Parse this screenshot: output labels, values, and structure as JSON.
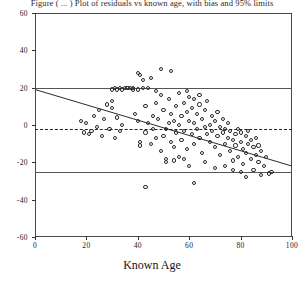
{
  "chart_data": {
    "type": "scatter",
    "title": "Figure ( ... ) Plot of residuals vs known age, with bias and 95% limits",
    "xlabel": "Known Age",
    "ylabel": "",
    "xlim": [
      0,
      100
    ],
    "ylim": [
      -60,
      60
    ],
    "xticks": [
      0,
      20,
      40,
      60,
      80,
      100
    ],
    "yticks": [
      60,
      40,
      20,
      0,
      -20,
      -40,
      -60
    ],
    "grid": false,
    "legend": "none",
    "annotations": {
      "upper_limit_label": "+20",
      "mean_bias_label": "-2",
      "lower_limit_label": "-25"
    },
    "reference_lines": [
      {
        "name": "upper-agreement-limit",
        "y": 20,
        "style": "solid"
      },
      {
        "name": "mean-bias-line",
        "y": -2,
        "style": "dashed"
      },
      {
        "name": "lower-agreement-limit",
        "y": -25,
        "style": "solid"
      }
    ],
    "regression_line": {
      "name": "regression-line",
      "x_start": 0,
      "y_start": 19,
      "x_end": 100,
      "y_end": -22,
      "slope": -0.41,
      "intercept": 19
    },
    "points": [
      [
        18,
        2
      ],
      [
        19,
        -4
      ],
      [
        20,
        1
      ],
      [
        21,
        -5
      ],
      [
        22,
        -3
      ],
      [
        23,
        5
      ],
      [
        24,
        -1
      ],
      [
        25,
        8
      ],
      [
        26,
        -6
      ],
      [
        27,
        3
      ],
      [
        28,
        11
      ],
      [
        29,
        -2
      ],
      [
        30,
        9
      ],
      [
        30,
        13
      ],
      [
        31,
        -7
      ],
      [
        32,
        4
      ],
      [
        33,
        -3
      ],
      [
        34,
        0
      ],
      [
        35,
        20
      ],
      [
        36,
        20
      ],
      [
        37,
        20
      ],
      [
        38,
        20
      ],
      [
        38,
        19
      ],
      [
        39,
        6
      ],
      [
        40,
        19
      ],
      [
        40,
        2
      ],
      [
        40,
        28
      ],
      [
        41,
        -9
      ],
      [
        41,
        -11
      ],
      [
        42,
        24
      ],
      [
        42,
        20
      ],
      [
        43,
        10
      ],
      [
        43,
        -4
      ],
      [
        44,
        20
      ],
      [
        44,
        1
      ],
      [
        45,
        -10
      ],
      [
        46,
        5
      ],
      [
        46,
        -2
      ],
      [
        47,
        12
      ],
      [
        47,
        -7
      ],
      [
        48,
        3
      ],
      [
        49,
        -14
      ],
      [
        49,
        30
      ],
      [
        50,
        8
      ],
      [
        50,
        -6
      ],
      [
        51,
        -2
      ],
      [
        51,
        -18
      ],
      [
        52,
        14
      ],
      [
        52,
        1
      ],
      [
        53,
        -9
      ],
      [
        53,
        6
      ],
      [
        54,
        2
      ],
      [
        54,
        -12
      ],
      [
        55,
        10
      ],
      [
        55,
        -4
      ],
      [
        56,
        17
      ],
      [
        56,
        0
      ],
      [
        57,
        -8
      ],
      [
        57,
        5
      ],
      [
        58,
        12
      ],
      [
        58,
        -3
      ],
      [
        59,
        7
      ],
      [
        59,
        -13
      ],
      [
        60,
        2
      ],
      [
        60,
        15
      ],
      [
        61,
        -5
      ],
      [
        61,
        9
      ],
      [
        62,
        1
      ],
      [
        62,
        -10
      ],
      [
        63,
        6
      ],
      [
        63,
        -2
      ],
      [
        64,
        11
      ],
      [
        64,
        -7
      ],
      [
        65,
        3
      ],
      [
        65,
        -15
      ],
      [
        66,
        8
      ],
      [
        66,
        -1
      ],
      [
        67,
        -5
      ],
      [
        67,
        13
      ],
      [
        68,
        0
      ],
      [
        68,
        -9
      ],
      [
        69,
        5
      ],
      [
        69,
        -3
      ],
      [
        70,
        -12
      ],
      [
        70,
        2
      ],
      [
        71,
        -6
      ],
      [
        71,
        7
      ],
      [
        72,
        -1
      ],
      [
        72,
        -16
      ],
      [
        73,
        -4
      ],
      [
        73,
        3
      ],
      [
        74,
        -10
      ],
      [
        74,
        -2
      ],
      [
        75,
        -7
      ],
      [
        75,
        1
      ],
      [
        76,
        -14
      ],
      [
        76,
        -3
      ],
      [
        77,
        -8
      ],
      [
        77,
        -19
      ],
      [
        78,
        -5
      ],
      [
        78,
        -11
      ],
      [
        79,
        -2
      ],
      [
        79,
        -17
      ],
      [
        80,
        -9
      ],
      [
        80,
        -4
      ],
      [
        81,
        -13
      ],
      [
        81,
        -21
      ],
      [
        82,
        -6
      ],
      [
        82,
        -15
      ],
      [
        83,
        -10
      ],
      [
        83,
        -3
      ],
      [
        84,
        -18
      ],
      [
        84,
        -8
      ],
      [
        85,
        -12
      ],
      [
        85,
        -24
      ],
      [
        86,
        -7
      ],
      [
        86,
        -16
      ],
      [
        87,
        -20
      ],
      [
        87,
        -11
      ],
      [
        88,
        -14
      ],
      [
        89,
        -22
      ],
      [
        90,
        -17
      ],
      [
        91,
        -26
      ],
      [
        92,
        -25
      ],
      [
        43,
        -33
      ],
      [
        62,
        -31
      ],
      [
        82,
        -28
      ],
      [
        88,
        -27
      ],
      [
        30,
        19
      ],
      [
        31,
        20
      ],
      [
        32,
        19
      ],
      [
        33,
        20
      ],
      [
        34,
        19
      ],
      [
        53,
        29
      ],
      [
        41,
        27
      ],
      [
        45,
        25
      ],
      [
        47,
        18
      ],
      [
        49,
        16
      ],
      [
        51,
        -20
      ],
      [
        58,
        -18
      ],
      [
        60,
        -22
      ],
      [
        66,
        -20
      ],
      [
        70,
        -23
      ],
      [
        74,
        -22
      ],
      [
        77,
        -24
      ],
      [
        80,
        -25
      ],
      [
        62,
        14
      ],
      [
        64,
        16
      ],
      [
        59,
        18
      ],
      [
        56,
        -17
      ],
      [
        54,
        -19
      ]
    ]
  }
}
